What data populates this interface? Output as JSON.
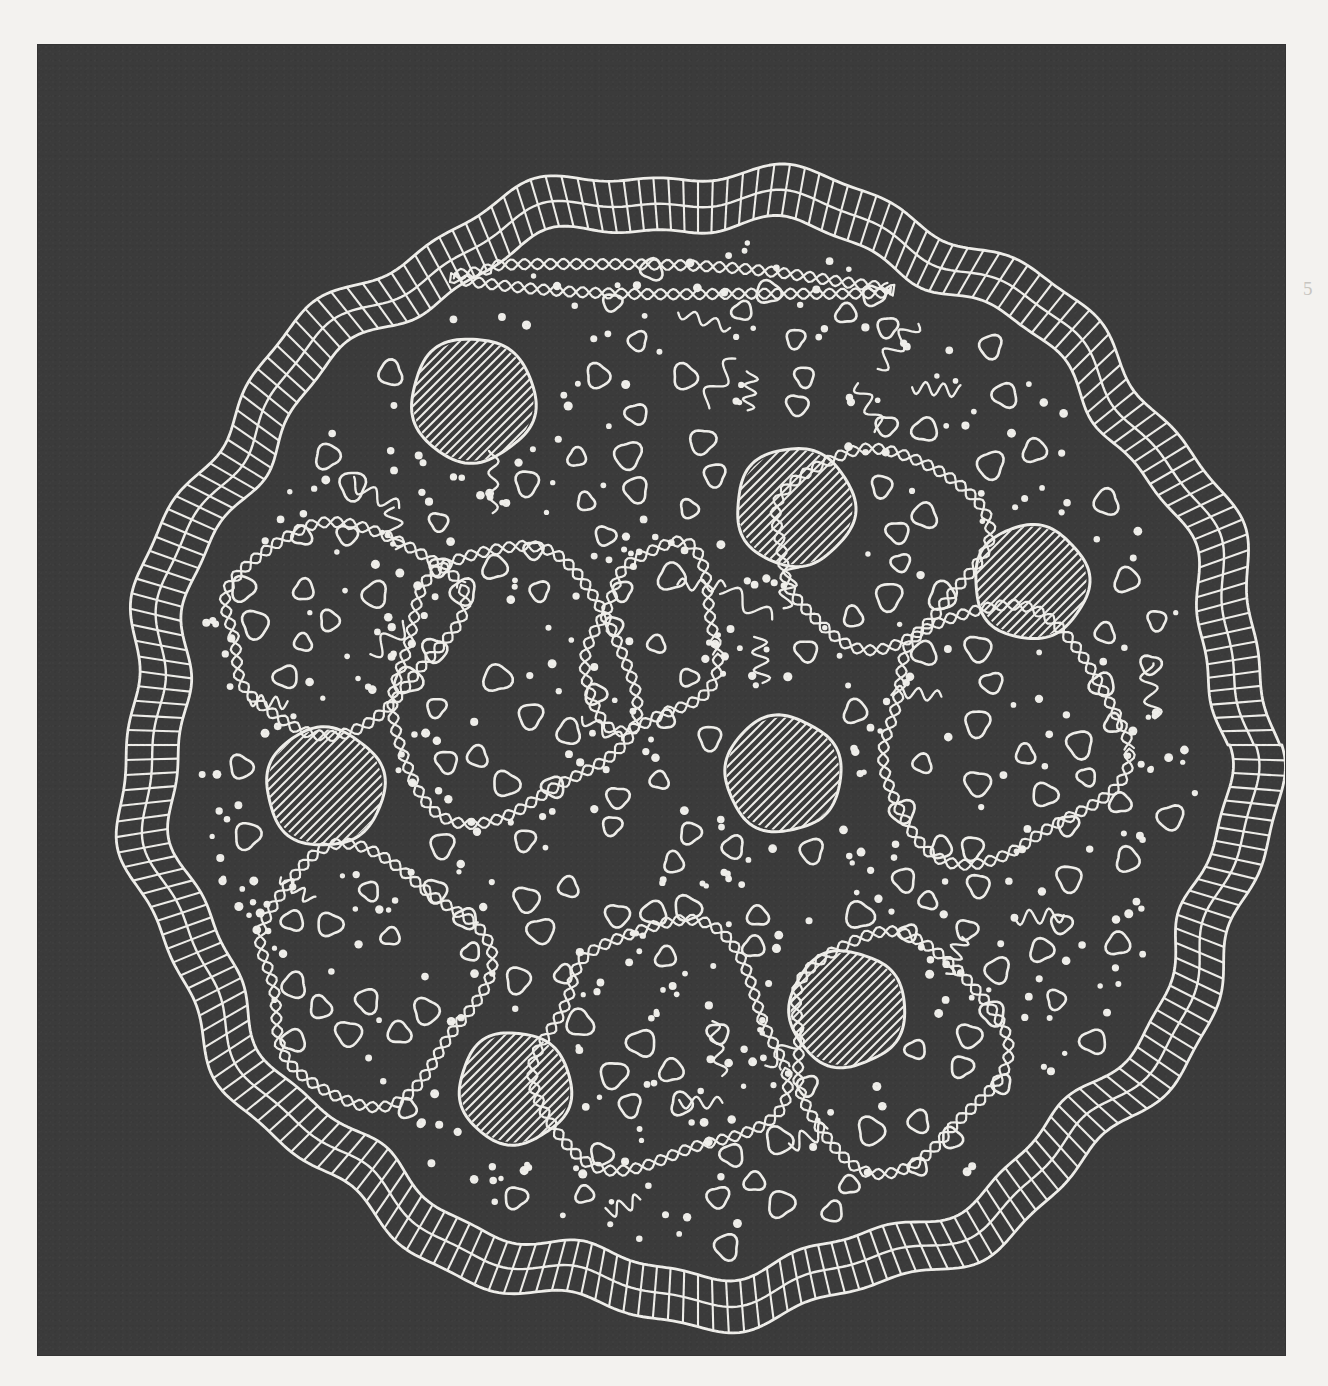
{
  "figure": {
    "domain": "scientific-illustration",
    "style": "pen-and-ink line drawing, white ink on dark gray halftone ground",
    "margin_mark": "5"
  },
  "colors": {
    "page_background": "#f3f2ef",
    "panel_background": "#3b3b3b",
    "ink": "#efeeea"
  },
  "panel": {
    "x": 38,
    "y": 45,
    "width": 1247,
    "height": 1310
  },
  "membrane": {
    "name": "cell-envelope",
    "description": "wavy polygonal double-layered ladder (bilayer) with perpendicular rungs",
    "center": {
      "cx": 660,
      "cy": 700
    },
    "outer_radius": 575,
    "layer_gap": 26,
    "rung_count": 240,
    "lobes": 13,
    "lobe_amplitude": 11
  },
  "cytoplasm": {
    "name": "cytoplasm-boundary",
    "center": {
      "cx": 660,
      "cy": 700
    },
    "radius": 512,
    "lobes": 13,
    "lobe_amplitude": 9
  },
  "chart_data": {
    "type": "scatter",
    "xlabel": "",
    "ylabel": "",
    "granules": [
      {
        "cx": 435,
        "cy": 355,
        "r": 62,
        "label": "storage-granule-1"
      },
      {
        "cx": 757,
        "cy": 462,
        "r": 59,
        "label": "storage-granule-2"
      },
      {
        "cx": 993,
        "cy": 537,
        "r": 57,
        "label": "storage-granule-3"
      },
      {
        "cx": 287,
        "cy": 742,
        "r": 59,
        "label": "storage-granule-4"
      },
      {
        "cx": 745,
        "cy": 729,
        "r": 58,
        "label": "storage-granule-5"
      },
      {
        "cx": 809,
        "cy": 964,
        "r": 58,
        "label": "storage-granule-6"
      },
      {
        "cx": 477,
        "cy": 1043,
        "r": 56,
        "label": "storage-granule-7"
      }
    ],
    "nucleoid_loops": [
      {
        "label": "nucleoid-loop-upper-left",
        "cx": 300,
        "cy": 580,
        "rx": 118,
        "ry": 95,
        "rot": -18
      },
      {
        "label": "nucleoid-loop-central",
        "cx": 470,
        "cy": 640,
        "rx": 120,
        "ry": 130,
        "rot": 10
      },
      {
        "label": "nucleoid-loop-mid-small",
        "cx": 615,
        "cy": 595,
        "rx": 62,
        "ry": 92,
        "rot": 12
      },
      {
        "label": "nucleoid-loop-upper-right",
        "cx": 840,
        "cy": 500,
        "rx": 105,
        "ry": 92,
        "rot": -12
      },
      {
        "label": "nucleoid-loop-right",
        "cx": 960,
        "cy": 690,
        "rx": 120,
        "ry": 120,
        "rot": 6
      },
      {
        "label": "nucleoid-loop-lower-left",
        "cx": 330,
        "cy": 930,
        "rx": 110,
        "ry": 120,
        "rot": -25
      },
      {
        "label": "nucleoid-loop-lower-mid",
        "cx": 620,
        "cy": 1005,
        "rx": 120,
        "ry": 120,
        "rot": 8
      },
      {
        "label": "nucleoid-loop-lower-right",
        "cx": 855,
        "cy": 1005,
        "rx": 105,
        "ry": 110,
        "rot": -6
      },
      {
        "label": "nucleoid-strand-top",
        "cx": 620,
        "cy": 235,
        "rx": 210,
        "ry": 14,
        "rot": 2
      }
    ],
    "counts": {
      "storage_granules": 7,
      "nucleoid_loops": 9,
      "ribosomes_open_circles": 176,
      "filled_dots": 420,
      "mrna_squiggles": 26
    },
    "legend": [
      {
        "key": "envelope",
        "name": "Cell envelope (bilayer ladder)"
      },
      {
        "key": "nucleoid",
        "name": "Nucleoid DNA (twisted double strand)"
      },
      {
        "key": "granule",
        "name": "Storage granule (hatched)"
      },
      {
        "key": "ribosome",
        "name": "Ribosome (open circle)"
      },
      {
        "key": "dot",
        "name": "Cytoplasmic particle (filled dot)"
      },
      {
        "key": "mrna",
        "name": "mRNA strand (short squiggle)"
      }
    ]
  }
}
